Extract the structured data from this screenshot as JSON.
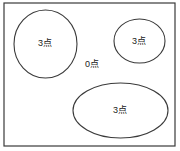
{
  "figure": {
    "background_color": "#ffffff",
    "stroke_color": "#3a3a3a",
    "text_color": "#1a1a1a",
    "frame": {
      "name": "outer-rectangle-frame",
      "x": 4,
      "y": 3,
      "width": 171,
      "height": 143,
      "stroke_width": 1.2
    },
    "shapes": [
      {
        "id": "circle-left",
        "kind": "circle",
        "cx": 45.5,
        "cy": 44,
        "rx": 31.5,
        "ry": 34,
        "label": "3点",
        "label_x": 45,
        "label_y": 43,
        "stroke_width": 1.1
      },
      {
        "id": "ellipse-right",
        "kind": "ellipse",
        "cx": 139.5,
        "cy": 41,
        "rx": 25.5,
        "ry": 22,
        "label": "3点",
        "label_x": 139,
        "label_y": 41,
        "stroke_width": 1.1
      },
      {
        "id": "ellipse-bottom",
        "kind": "ellipse",
        "cx": 120.5,
        "cy": 110.5,
        "rx": 47.5,
        "ry": 27.5,
        "label": "3点",
        "label_x": 120,
        "label_y": 110,
        "stroke_width": 1.1
      }
    ],
    "free_labels": [
      {
        "id": "label-zero-points",
        "text": "0点",
        "x": 92,
        "y": 64
      }
    ]
  }
}
